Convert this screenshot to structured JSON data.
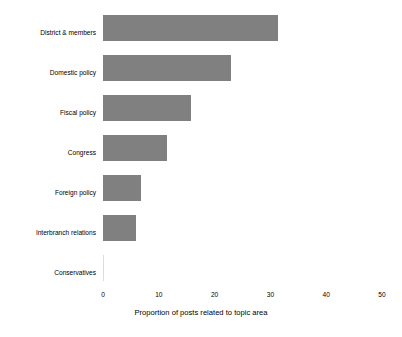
{
  "chart_data": {
    "type": "bar",
    "orientation": "horizontal",
    "title": "",
    "xlabel": "Proportion of posts related to topic area",
    "ylabel": "",
    "categories": [
      "District & members",
      "Domestic policy",
      "Fiscal policy",
      "Congress",
      "Foreign policy",
      "Interbranch relations",
      "Conservatives"
    ],
    "values": [
      31.4,
      22.9,
      15.8,
      11.5,
      6.8,
      5.9,
      0.1
    ],
    "xlim": [
      0,
      50
    ],
    "xticks": [
      0,
      10,
      20,
      30,
      40,
      50
    ],
    "xtick_labels": [
      "0",
      "10",
      "20",
      "30",
      "40",
      "50"
    ],
    "grid": false,
    "legend": false,
    "bar_color": "#808080",
    "background_color": "#ffffff",
    "text_color": "#000000"
  }
}
